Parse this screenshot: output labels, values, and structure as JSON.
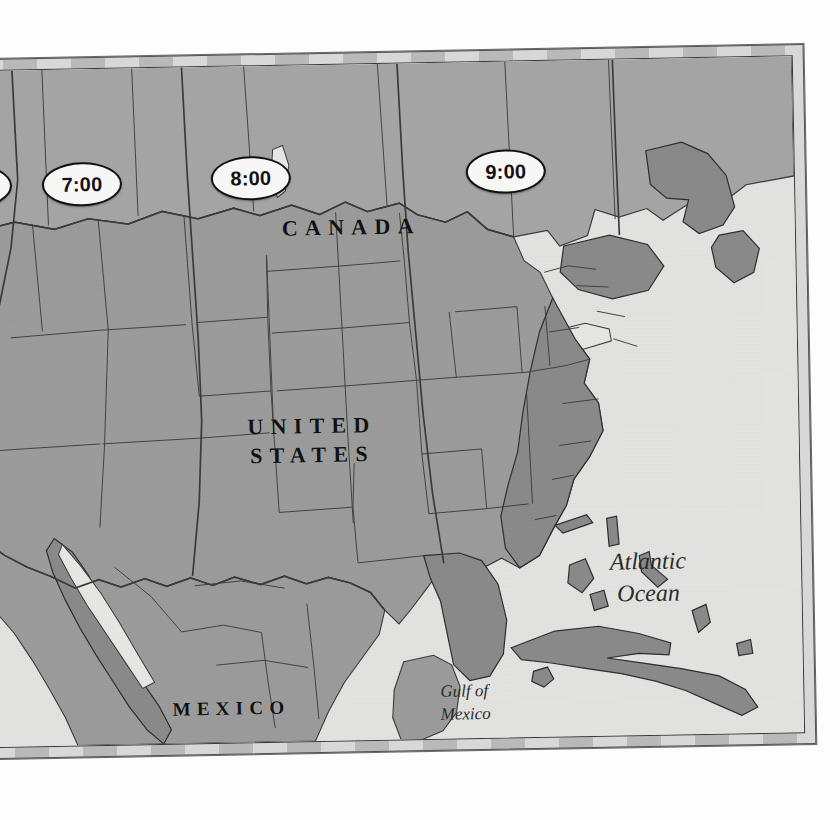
{
  "map": {
    "title_implied": "United States Time Zones",
    "colors": {
      "ocean": "#e4e4e2",
      "land_us": "#9d9d9d",
      "land_west": "#b0b0b0",
      "land_canada": "#a9a9a9",
      "land_dark": "#8a8a8a",
      "lakes": "#e8e8e6",
      "border_line": "#3a3a3a",
      "frame_light": "#d8d8d8",
      "frame_dark": "#b9b9b9",
      "label_text": "#111111",
      "callout_fill": "#f7f7f5"
    },
    "frame": {
      "style": "checkered-neatline",
      "segments": 26
    }
  },
  "time_zones": {
    "callouts": [
      {
        "id": "tz-0",
        "label": "6:00",
        "zone": "pacific",
        "clipped_at_left_edge": true
      },
      {
        "id": "tz-1",
        "label": "7:00",
        "zone": "mountain",
        "clipped_at_left_edge": false
      },
      {
        "id": "tz-2",
        "label": "8:00",
        "zone": "central",
        "clipped_at_left_edge": false
      },
      {
        "id": "tz-3",
        "label": "9:00",
        "zone": "eastern",
        "clipped_at_left_edge": false
      }
    ]
  },
  "labels": {
    "countries": [
      {
        "id": "canada",
        "text": "CANADA"
      },
      {
        "id": "united_states_line1",
        "text": "UNITED"
      },
      {
        "id": "united_states_line2",
        "text": "STATES"
      },
      {
        "id": "mexico",
        "text": "MEXICO"
      }
    ],
    "water_bodies": [
      {
        "id": "atlantic_line1",
        "text": "Atlantic"
      },
      {
        "id": "atlantic_line2",
        "text": "Ocean"
      },
      {
        "id": "gulf_line1",
        "text": "Gulf of"
      },
      {
        "id": "gulf_line2",
        "text": "Mexico"
      }
    ]
  }
}
